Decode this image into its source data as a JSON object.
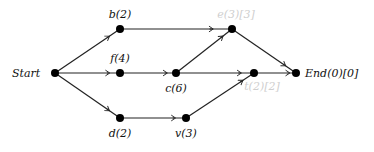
{
  "diagram": {
    "type": "directed-graph",
    "nodes": [
      {
        "id": "start",
        "label": "Start",
        "x": 55,
        "y": 73,
        "lx": 12,
        "ly": 77,
        "anchor": "start",
        "faint": false
      },
      {
        "id": "b",
        "label": "b(2)",
        "x": 120,
        "y": 29,
        "lx": 120,
        "ly": 18,
        "anchor": "middle",
        "faint": false
      },
      {
        "id": "f",
        "label": "f(4)",
        "x": 120,
        "y": 73,
        "lx": 120,
        "ly": 62,
        "anchor": "middle",
        "faint": false
      },
      {
        "id": "c",
        "label": "c(6)",
        "x": 176,
        "y": 73,
        "lx": 176,
        "ly": 92,
        "anchor": "middle",
        "faint": false
      },
      {
        "id": "e",
        "label": "e(3)[3]",
        "x": 232,
        "y": 29,
        "lx": 236,
        "ly": 18,
        "anchor": "middle",
        "faint": true
      },
      {
        "id": "t",
        "label": "t(2)[2]",
        "x": 254,
        "y": 73,
        "lx": 262,
        "ly": 90,
        "anchor": "middle",
        "faint": true
      },
      {
        "id": "end",
        "label": "End(0)[0]",
        "x": 296,
        "y": 73,
        "lx": 305,
        "ly": 77,
        "anchor": "start",
        "faint": false
      },
      {
        "id": "d",
        "label": "d(2)",
        "x": 120,
        "y": 118,
        "lx": 120,
        "ly": 137,
        "anchor": "middle",
        "faint": false
      },
      {
        "id": "v",
        "label": "v(3)",
        "x": 186,
        "y": 118,
        "lx": 186,
        "ly": 137,
        "anchor": "middle",
        "faint": false
      }
    ],
    "edges": [
      {
        "from": "start",
        "to": "b"
      },
      {
        "from": "start",
        "to": "f"
      },
      {
        "from": "start",
        "to": "d"
      },
      {
        "from": "b",
        "to": "e"
      },
      {
        "from": "f",
        "to": "c"
      },
      {
        "from": "c",
        "to": "e"
      },
      {
        "from": "c",
        "to": "t"
      },
      {
        "from": "t",
        "to": "end"
      },
      {
        "from": "e",
        "to": "end"
      },
      {
        "from": "d",
        "to": "v"
      },
      {
        "from": "v",
        "to": "t"
      }
    ],
    "colors": {
      "node": "#000000",
      "edge": "#222222",
      "label": "#111111",
      "faint_label": "#cfcfcf"
    }
  }
}
